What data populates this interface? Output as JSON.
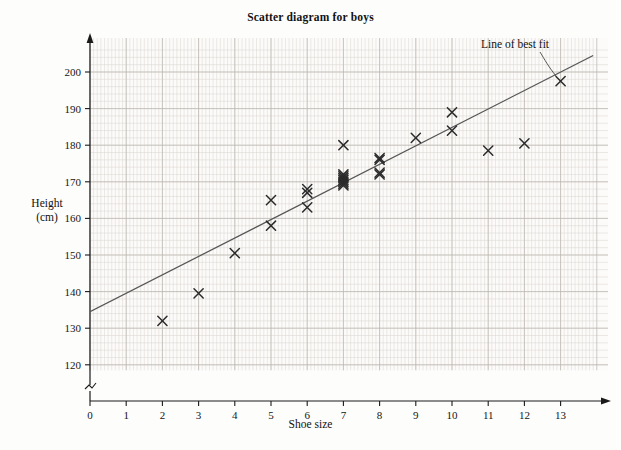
{
  "chart_data": {
    "type": "scatter",
    "title": "Scatter diagram for boys",
    "xlabel": "Shoe size",
    "ylabel": "Height (cm)",
    "ylabel_line1": "Height",
    "ylabel_line2": "(cm)",
    "xlim": [
      0,
      13.9
    ],
    "ylim": [
      118,
      205
    ],
    "xticks": [
      0,
      1,
      2,
      3,
      4,
      5,
      6,
      7,
      8,
      9,
      10,
      11,
      12,
      13
    ],
    "xtick_labels": [
      "0",
      "1",
      "2",
      "3",
      "4",
      "5",
      "6",
      "7",
      "8",
      "9",
      "10",
      "11",
      "12",
      "13"
    ],
    "yticks": [
      120,
      130,
      140,
      150,
      160,
      170,
      180,
      190,
      200
    ],
    "ytick_labels": [
      "120",
      "130",
      "140",
      "150",
      "160",
      "170",
      "180",
      "190",
      "200"
    ],
    "grid": true,
    "grid_minor_step_x": 0.1,
    "grid_minor_step_y": 2,
    "y_axis_break": true,
    "marker": "x-cross",
    "points": [
      {
        "x": 2,
        "y": 132
      },
      {
        "x": 3,
        "y": 139.5
      },
      {
        "x": 4,
        "y": 150.5
      },
      {
        "x": 5,
        "y": 165
      },
      {
        "x": 5,
        "y": 158
      },
      {
        "x": 6,
        "y": 168
      },
      {
        "x": 6,
        "y": 167
      },
      {
        "x": 6,
        "y": 163
      },
      {
        "x": 7,
        "y": 180
      },
      {
        "x": 7,
        "y": 172
      },
      {
        "x": 7,
        "y": 171.5
      },
      {
        "x": 7,
        "y": 171
      },
      {
        "x": 7,
        "y": 170.5
      },
      {
        "x": 7,
        "y": 170
      },
      {
        "x": 7,
        "y": 169.5
      },
      {
        "x": 7,
        "y": 169
      },
      {
        "x": 8,
        "y": 176.5
      },
      {
        "x": 8,
        "y": 176
      },
      {
        "x": 8,
        "y": 172.5
      },
      {
        "x": 8,
        "y": 172
      },
      {
        "x": 9,
        "y": 182
      },
      {
        "x": 10,
        "y": 189
      },
      {
        "x": 10,
        "y": 184
      },
      {
        "x": 11,
        "y": 178.5
      },
      {
        "x": 12,
        "y": 180.5
      },
      {
        "x": 13,
        "y": 197.5
      }
    ],
    "line_of_best_fit": {
      "label": "Line of best fit",
      "from": {
        "x": 0,
        "y": 134.5
      },
      "to": {
        "x": 13.9,
        "y": 204.5
      }
    },
    "colors": {
      "marker": "#2b2b2b",
      "axis": "#1a1a1a",
      "fit_line": "#555555",
      "grid_minor": "#d8d4cf",
      "grid_major": "#b9b4ae",
      "background": "#fdfdfc"
    }
  }
}
